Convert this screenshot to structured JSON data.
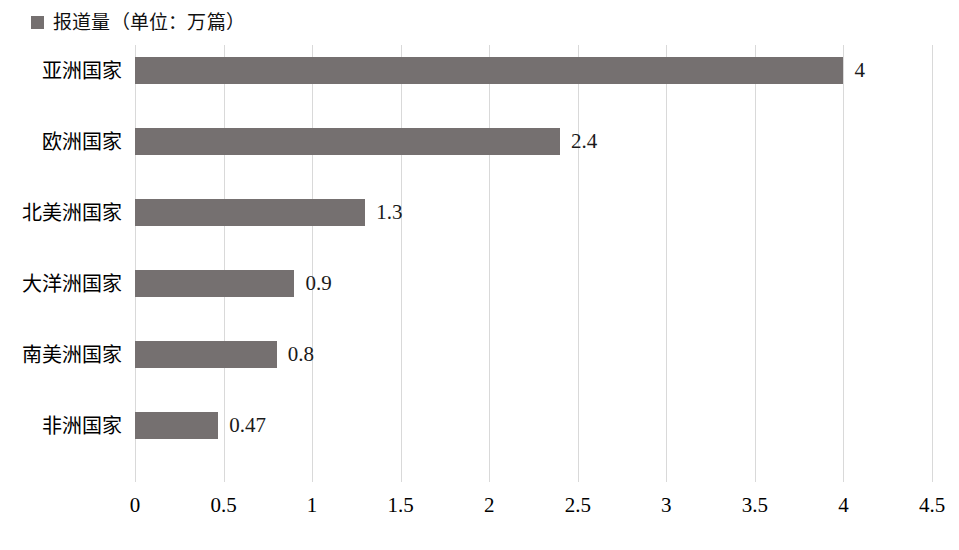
{
  "legend": {
    "marker_name": "legend-swatch",
    "label": "报道量（单位：万篇）",
    "color": "#757070"
  },
  "axis": {
    "x_ticks": [
      "0",
      "0.5",
      "1",
      "1.5",
      "2",
      "2.5",
      "3",
      "3.5",
      "4",
      "4.5"
    ]
  },
  "chart_data": {
    "type": "bar",
    "orientation": "horizontal",
    "title": "",
    "subtitle": "",
    "xlabel": "",
    "ylabel": "",
    "series_name": "报道量（单位：万篇）",
    "unit": "万篇",
    "categories": [
      "亚洲国家",
      "欧洲国家",
      "北美洲国家",
      "大洋洲国家",
      "南美洲国家",
      "非洲国家"
    ],
    "values": [
      4,
      2.4,
      1.3,
      0.9,
      0.8,
      0.47
    ],
    "value_labels": [
      "4",
      "2.4",
      "1.3",
      "0.9",
      "0.8",
      "0.47"
    ],
    "xlim": [
      0,
      4.5
    ],
    "xticks": [
      0,
      0.5,
      1,
      1.5,
      2,
      2.5,
      3,
      3.5,
      4,
      4.5
    ],
    "grid": "vertical",
    "legend_position": "top-left",
    "bar_color": "#757070",
    "gridline_color": "#d9d9d9",
    "background": "#ffffff"
  }
}
